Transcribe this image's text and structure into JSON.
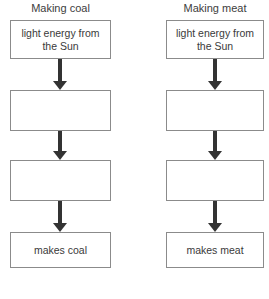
{
  "diagram": {
    "title": "",
    "columns": [
      {
        "title": "Making coal",
        "nodes": [
          {
            "label": "light energy from the Sun"
          },
          {
            "label": ""
          },
          {
            "label": ""
          },
          {
            "label": "makes coal"
          }
        ],
        "arrows": [
          "down-arrow",
          "down-arrow",
          "down-arrow"
        ]
      },
      {
        "title": "Making meat",
        "nodes": [
          {
            "label": "light energy from the Sun"
          },
          {
            "label": ""
          },
          {
            "label": ""
          },
          {
            "label": "makes meat"
          }
        ],
        "arrows": [
          "down-arrow",
          "down-arrow",
          "down-arrow"
        ]
      }
    ],
    "separator": "dotted-line",
    "colors": {
      "box_border": "#8b8b8b",
      "arrow": "#333333",
      "text": "#3a3a3a",
      "background": "#ffffff",
      "separator": "#4a4a4a"
    }
  }
}
